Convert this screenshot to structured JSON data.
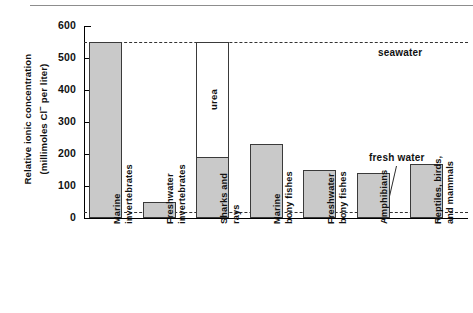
{
  "figure": {
    "y_axis_label_line1": "Relative ionic concentration",
    "y_axis_label_line2": "(millimoles Cl",
    "y_axis_label_line2b": "per liter)",
    "y_axis_superscript": "−",
    "urea_label": "urea",
    "seawater_label": "seawater",
    "freshwater_label": "fresh water",
    "bar_fill_color": "#c9c9c9",
    "bar_stroke_color": "#3a3a3a",
    "refline_color": "#333333"
  },
  "chart_data": {
    "type": "bar",
    "title": "",
    "xlabel": "",
    "ylabel": "Relative ionic concentration (millimoles Cl− per liter)",
    "ylim": [
      0,
      600
    ],
    "yticks": [
      0,
      100,
      200,
      300,
      400,
      500,
      600
    ],
    "ytick_labels": [
      "0",
      "100",
      "200",
      "300",
      "400",
      "500",
      "600"
    ],
    "grid": false,
    "legend": "none",
    "categories": [
      "Marine invertebrates",
      "Freshwater invertebrates",
      "Sharks and rays",
      "Marine bony fishes",
      "Freshwater bony fishes",
      "Amphibians",
      "Reptiles, birds, and mammals"
    ],
    "category_lines": [
      [
        "Marine",
        "invertebrates"
      ],
      [
        "Freshwater",
        "invertebrates"
      ],
      [
        "Sharks and",
        "rays"
      ],
      [
        "Marine",
        "bony fishes"
      ],
      [
        "Freshwater",
        "bony fishes"
      ],
      [
        "Amphibians",
        ""
      ],
      [
        "Reptiles, birds,",
        "and mammals"
      ]
    ],
    "values": [
      550,
      50,
      190,
      230,
      150,
      140,
      170
    ],
    "series": [
      {
        "name": "Ionic (Cl−) concentration",
        "values": [
          550,
          50,
          190,
          230,
          150,
          140,
          170
        ]
      },
      {
        "name": "urea (sharks and rays only)",
        "values": [
          0,
          0,
          360,
          0,
          0,
          0,
          0
        ],
        "note": "white open segment stacked from 190 up to 550"
      }
    ],
    "annotations": [
      {
        "label": "urea",
        "category": "Sharks and rays",
        "range": [
          190,
          550
        ]
      },
      {
        "label": "seawater",
        "type": "reference-line",
        "value": 550
      },
      {
        "label": "fresh water",
        "type": "reference-line",
        "value": 20
      }
    ],
    "reference_lines": [
      {
        "name": "seawater",
        "value": 550,
        "style": "dashed"
      },
      {
        "name": "fresh water",
        "value": 20,
        "style": "dashed"
      }
    ]
  }
}
